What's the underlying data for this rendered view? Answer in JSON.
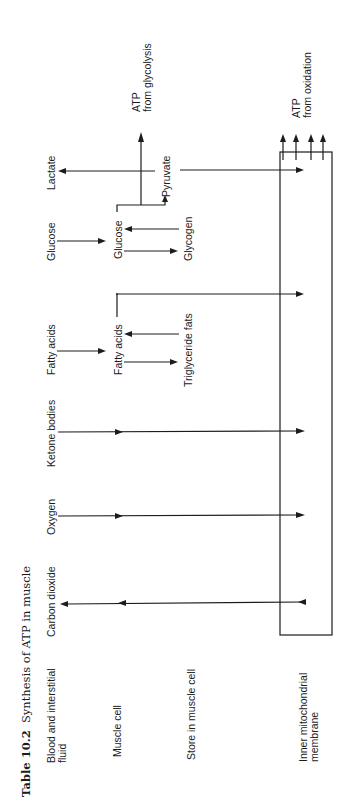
{
  "table": {
    "number": "Table 10.2",
    "title": "Synthesis of ATP in muscle"
  },
  "row_labels": {
    "blood": "Blood and interstitial",
    "blood_2": "fluid",
    "muscle_cell": "Muscle cell",
    "store": "Store in muscle cell",
    "membrane": "Inner mitochondrial",
    "membrane_2": "membrane"
  },
  "blood_column": {
    "co2": "Carbon dioxide",
    "oxygen": "Oxygen",
    "ketone": "Ketone bodies",
    "fatty_acids": "Fatty acids",
    "glucose": "Glucose",
    "lactate": "Lactate"
  },
  "muscle_column": {
    "fatty_acids": "Fatty acids",
    "glucose": "Glucose",
    "pyruvate": "Pyruvate"
  },
  "store_column": {
    "triglyceride": "Triglyceride fats",
    "glycogen": "Glycogen"
  },
  "outputs": {
    "glycolysis_1": "ATP",
    "glycolysis_2": "from glycolysis",
    "oxidation_1": "ATP",
    "oxidation_2": "from oxidation"
  }
}
